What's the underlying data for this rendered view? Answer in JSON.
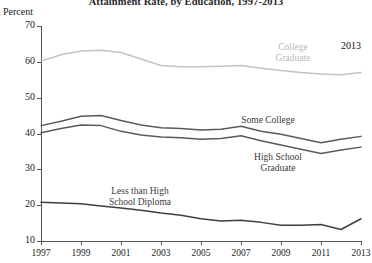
{
  "chart_data": {
    "type": "line",
    "title": "Attainment Rate, by Education, 1997-2013",
    "xlabel": "",
    "ylabel": "Percent",
    "ylim": [
      10,
      70
    ],
    "xlim": [
      1997,
      2013
    ],
    "yticks": [
      10,
      20,
      30,
      40,
      50,
      60,
      70
    ],
    "xticks": [
      1997,
      1999,
      2001,
      2003,
      2005,
      2007,
      2009,
      2011,
      2013
    ],
    "xtick_labels": [
      "1997",
      "1999",
      "2001",
      "2003",
      "2005",
      "2007",
      "2009",
      "2011",
      "2013"
    ],
    "ytick_labels": [
      "10",
      "20",
      "30",
      "40",
      "50",
      "60",
      "70"
    ],
    "grid": false,
    "legend_position": "inline",
    "x": [
      1997,
      1998,
      1999,
      2000,
      2001,
      2002,
      2003,
      2004,
      2005,
      2006,
      2007,
      2008,
      2009,
      2010,
      2011,
      2012,
      2013
    ],
    "series": [
      {
        "name": "College Graduate",
        "color": "#c2c2c2",
        "values": [
          60.2,
          62.0,
          63.0,
          63.2,
          62.6,
          60.8,
          59.0,
          58.6,
          58.6,
          58.8,
          59.0,
          58.2,
          57.6,
          57.0,
          56.6,
          56.4,
          57.0
        ]
      },
      {
        "name": "Some College",
        "color": "#5a5a5a",
        "values": [
          42.2,
          43.4,
          44.8,
          45.0,
          43.6,
          42.4,
          41.6,
          41.4,
          41.0,
          41.2,
          42.0,
          40.6,
          39.8,
          38.6,
          37.4,
          38.4,
          39.2
        ]
      },
      {
        "name": "High School Graduate",
        "color": "#5a5a5a",
        "values": [
          40.2,
          41.4,
          42.4,
          42.2,
          40.6,
          39.6,
          39.0,
          38.8,
          38.4,
          38.6,
          39.4,
          38.0,
          36.8,
          35.6,
          34.4,
          35.4,
          36.2
        ]
      },
      {
        "name": "Less than High School Diploma",
        "color": "#3f3f3f",
        "values": [
          20.8,
          20.6,
          20.4,
          19.8,
          19.2,
          18.6,
          17.8,
          17.2,
          16.2,
          15.6,
          15.8,
          15.2,
          14.4,
          14.4,
          14.6,
          13.2,
          16.2
        ]
      }
    ],
    "annotations": [
      {
        "text": "2013",
        "x": 2013,
        "y": 66
      }
    ]
  },
  "labels": {
    "college_graduate": "College",
    "college_graduate_2": "Graduate",
    "some_college": "Some College",
    "high_school": "High School",
    "high_school_2": "Graduate",
    "less_than_hs": "Less than High",
    "less_than_hs_2": "School Diploma",
    "year_annotation": "2013"
  }
}
